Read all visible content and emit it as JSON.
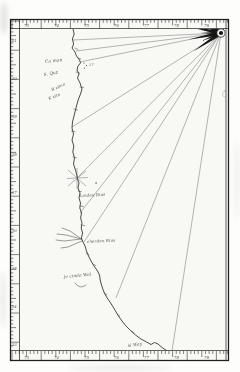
{
  "colors": {
    "paper": "#f8f8f5",
    "margin": "#fdfdfc",
    "ink": "#1e1e1e",
    "coast": "#383838",
    "rhumb_ray": "#5f5f5f",
    "handwriting": "#35332f"
  },
  "compass": {
    "cx": 221,
    "cy": 33,
    "start_angle_deg": 146.25,
    "step_deg": 11.25,
    "spoke_count": 13,
    "long_spoke_len": 33,
    "short_spoke_len": 21
  },
  "rhumb_rays": [
    [
      73,
      40
    ],
    [
      76,
      51
    ],
    [
      80,
      62
    ],
    [
      72,
      127
    ],
    [
      77,
      178
    ],
    [
      80,
      213
    ],
    [
      84,
      242
    ],
    [
      116,
      298
    ],
    [
      172,
      351
    ]
  ],
  "place_labels": [
    {
      "text": "Ca man",
      "x": 45,
      "y": 63,
      "rot": -6,
      "size": 4.4
    },
    {
      "text": "17",
      "x": 89,
      "y": 66,
      "rot": 0,
      "size": 3.5
    },
    {
      "text": "S. Quz",
      "x": 44,
      "y": 76,
      "rot": -10,
      "size": 4.2
    },
    {
      "text": "R zimo",
      "x": 52,
      "y": 91,
      "rot": -24,
      "size": 4.0
    },
    {
      "text": "K zito",
      "x": 49,
      "y": 100,
      "rot": -22,
      "size": 4.0
    },
    {
      "text": "a",
      "x": 95,
      "y": 184,
      "rot": 0,
      "size": 3.8
    },
    {
      "text": "landen Rios",
      "x": 80,
      "y": 197,
      "rot": -3,
      "size": 4.0
    },
    {
      "text": "cherden Rios",
      "x": 87,
      "y": 243,
      "rot": -3,
      "size": 4.0
    },
    {
      "text": "je cinda Wal",
      "x": 64,
      "y": 278,
      "rot": -5,
      "size": 4.2
    },
    {
      "text": "si Way",
      "x": 128,
      "y": 347,
      "rot": -8,
      "size": 4.2
    }
  ],
  "border_scale": {
    "top_labels": [
      "73",
      "74",
      "75",
      "76",
      "77",
      "78",
      "79"
    ],
    "bottom_labels": [
      "73",
      "74",
      "75",
      "76",
      "77",
      "78",
      "79"
    ],
    "left_labels": [
      "41",
      "40",
      "39",
      "38",
      "37",
      "36",
      "35",
      "34",
      "33"
    ]
  }
}
